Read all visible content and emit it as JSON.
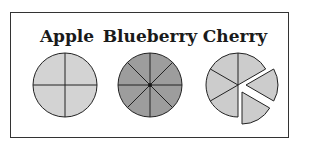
{
  "labels": {
    "apple": "Apple",
    "blueberry": "Blueberry",
    "cherry": "Cherry"
  },
  "pies": [
    {
      "name": "Apple",
      "slices": 4,
      "fill": "#d3d3d3",
      "exploded_slices": 0
    },
    {
      "name": "Blueberry",
      "slices": 8,
      "fill": "#9d9d9d",
      "exploded_slices": 0
    },
    {
      "name": "Cherry",
      "slices": 6,
      "fill": "#cccccc",
      "exploded_slices": 2
    }
  ],
  "colors": {
    "outline": "#222222",
    "frame": "#333333",
    "background": "#ffffff"
  }
}
